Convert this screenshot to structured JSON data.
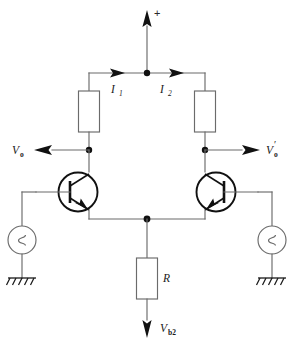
{
  "diagram": {
    "type": "electronic-circuit-schematic",
    "colors": {
      "wire": "#6b6b6b",
      "device": "#111111",
      "background": "#ffffff",
      "label": "#1a1a1a"
    }
  },
  "labels": {
    "supply_plus": "+",
    "current_left": "I",
    "current_left_sub": "1",
    "current_right": "I",
    "current_right_sub": "2",
    "out_left": "V",
    "out_left_sub": "o",
    "out_right": "V",
    "out_right_prime": "′",
    "out_right_sub": "o",
    "resistor_tail": "R",
    "bias_voltage": "V",
    "bias_voltage_sub": "b2"
  },
  "components": {
    "collector_resistor_left": {
      "name": "collector-resistor-left",
      "label": ""
    },
    "collector_resistor_right": {
      "name": "collector-resistor-right",
      "label": ""
    },
    "tail_resistor": {
      "name": "tail-resistor",
      "label": "R"
    },
    "transistor_left": {
      "name": "npn-transistor-left",
      "type": "NPN"
    },
    "transistor_right": {
      "name": "npn-transistor-right",
      "type": "NPN"
    },
    "source_left": {
      "name": "ac-source-left",
      "symbol": "sine"
    },
    "source_right": {
      "name": "ac-source-right",
      "symbol": "sine"
    },
    "ground_left": {
      "name": "ground-left",
      "symbol": "chassis-ground"
    },
    "ground_right": {
      "name": "ground-right",
      "symbol": "chassis-ground"
    }
  },
  "nodes": {
    "supply_node": "supply-rail-node",
    "out_node_left": "output-node-left",
    "out_node_right": "output-node-right",
    "emitter_node": "common-emitter-node"
  }
}
